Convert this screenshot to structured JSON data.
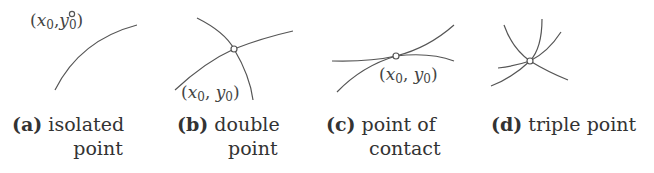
{
  "panels": [
    {
      "id": "a",
      "letter": "(a)",
      "caption_line1": "isolated",
      "caption_line2": "point",
      "point_label": {
        "x": "x",
        "x_sub": "0",
        "sep": ",",
        "y": "y",
        "y_sub": "0"
      }
    },
    {
      "id": "b",
      "letter": "(b)",
      "caption_line1": "double",
      "caption_line2": "point",
      "point_label": {
        "x": "x",
        "x_sub": "0",
        "sep": ",",
        "y": "y",
        "y_sub": "0"
      }
    },
    {
      "id": "c",
      "letter": "(c)",
      "caption_line1": "point of",
      "caption_line2": "contact",
      "point_label": {
        "x": "x",
        "x_sub": "0",
        "sep": ",",
        "y": "y",
        "y_sub": "0"
      }
    },
    {
      "id": "d",
      "letter": "(d)",
      "caption_line1": "triple point",
      "caption_line2": ""
    }
  ],
  "colors": {
    "stroke": "#555555",
    "text": "#333333",
    "background": "#ffffff"
  }
}
